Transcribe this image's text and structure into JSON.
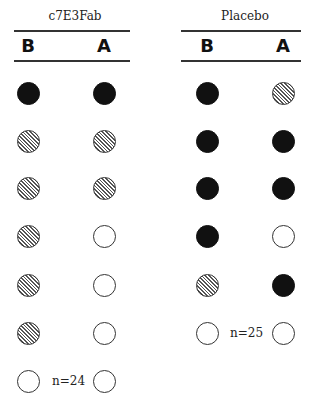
{
  "groups": [
    {
      "title": "c7E3Fab",
      "columns": [
        "B",
        "A"
      ],
      "n_label": "n=24",
      "rows": [
        [
          "filled",
          "filled"
        ],
        [
          "hatched",
          "hatched"
        ],
        [
          "hatched",
          "hatched"
        ],
        [
          "hatched",
          "empty"
        ],
        [
          "hatched",
          "empty"
        ],
        [
          "hatched",
          "empty"
        ],
        [
          "empty",
          "empty"
        ]
      ]
    },
    {
      "title": "Placebo",
      "columns": [
        "B",
        "A"
      ],
      "n_label": "n=25",
      "rows": [
        [
          "filled",
          "hatched"
        ],
        [
          "filled",
          "filled"
        ],
        [
          "filled",
          "filled"
        ],
        [
          "filled",
          "empty"
        ],
        [
          "hatched",
          "filled"
        ],
        [
          "empty",
          "empty"
        ]
      ]
    }
  ],
  "legend_styles": {
    "filled": "#111111",
    "hatched": "diagonal-hatch",
    "empty": "#ffffff"
  }
}
